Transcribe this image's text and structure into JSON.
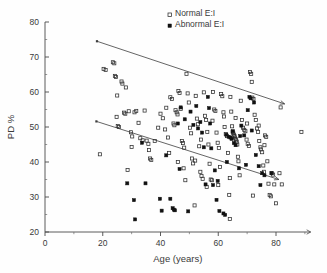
{
  "chart_data": {
    "type": "scatter",
    "title": "",
    "xlabel": "Age (years)",
    "ylabel": "PD %",
    "xlim": [
      0,
      92
    ],
    "ylim": [
      20,
      80
    ],
    "xticks": [
      0,
      20,
      40,
      60,
      80
    ],
    "yticks": [
      20,
      30,
      40,
      50,
      60,
      70,
      80
    ],
    "xtick_labels": [
      "0",
      "20",
      "40",
      "60",
      "80"
    ],
    "ytick_labels": [
      "20",
      "30",
      "40",
      "50",
      "60",
      "70",
      "80"
    ],
    "xminor_step": 10,
    "yminor_step": 5,
    "grid": false,
    "legend_position": "top-center",
    "legend": [
      {
        "label": "Normal E:I",
        "marker": "open-square",
        "color": "#2d2d2d"
      },
      {
        "label": "Abnormal E:I",
        "marker": "filled-square",
        "color": "#111111"
      }
    ],
    "series": [
      {
        "name": "Normal E:I",
        "marker": "open-square",
        "points": [
          [
            19.0,
            42.2
          ],
          [
            20.3,
            66.6
          ],
          [
            21.0,
            66.3
          ],
          [
            23.5,
            68.5
          ],
          [
            24.0,
            68.2
          ],
          [
            24.2,
            64.6
          ],
          [
            24.6,
            64.3
          ],
          [
            25.0,
            59.0
          ],
          [
            24.8,
            52.9
          ],
          [
            25.2,
            50.3
          ],
          [
            25.6,
            50.0
          ],
          [
            26.5,
            63.0
          ],
          [
            26.8,
            62.4
          ],
          [
            27.4,
            54.1
          ],
          [
            27.8,
            53.8
          ],
          [
            28.0,
            61.3
          ],
          [
            28.6,
            37.7
          ],
          [
            29.0,
            54.5
          ],
          [
            29.8,
            48.5
          ],
          [
            30.2,
            47.3
          ],
          [
            31.0,
            54.2
          ],
          [
            31.6,
            54.6
          ],
          [
            32.4,
            51.2
          ],
          [
            33.0,
            46.8
          ],
          [
            33.8,
            46.2
          ],
          [
            34.5,
            54.7
          ],
          [
            35.2,
            46.1
          ],
          [
            35.8,
            45.2
          ],
          [
            36.4,
            41.0
          ],
          [
            36.8,
            40.6
          ],
          [
            38.0,
            46.0
          ],
          [
            39.2,
            49.8
          ],
          [
            40.0,
            53.8
          ],
          [
            40.8,
            52.5
          ],
          [
            41.6,
            49.3
          ],
          [
            42.0,
            55.5
          ],
          [
            42.6,
            47.0
          ],
          [
            43.4,
            58.5
          ],
          [
            44.0,
            58.0
          ],
          [
            44.5,
            51.0
          ],
          [
            44.8,
            50.5
          ],
          [
            45.2,
            54.8
          ],
          [
            45.6,
            54.2
          ],
          [
            45.9,
            53.6
          ],
          [
            46.2,
            60.3
          ],
          [
            46.6,
            59.7
          ],
          [
            47.0,
            55.2
          ],
          [
            47.4,
            46.0
          ],
          [
            47.8,
            45.4
          ],
          [
            48.2,
            44.1
          ],
          [
            48.6,
            34.8
          ],
          [
            49.0,
            65.2
          ],
          [
            49.4,
            59.6
          ],
          [
            49.8,
            57.0
          ],
          [
            50.2,
            49.8
          ],
          [
            50.6,
            48.2
          ],
          [
            50.9,
            41.0
          ],
          [
            51.3,
            39.6
          ],
          [
            51.8,
            27.6
          ],
          [
            52.2,
            58.9
          ],
          [
            52.6,
            52.4
          ],
          [
            53.0,
            50.8
          ],
          [
            53.4,
            44.5
          ],
          [
            53.8,
            37.2
          ],
          [
            54.2,
            36.0
          ],
          [
            54.6,
            35.2
          ],
          [
            55.0,
            59.9
          ],
          [
            55.4,
            53.2
          ],
          [
            55.8,
            52.0
          ],
          [
            56.2,
            48.6
          ],
          [
            56.6,
            45.0
          ],
          [
            57.0,
            39.5
          ],
          [
            57.4,
            35.0
          ],
          [
            57.8,
            34.8
          ],
          [
            58.2,
            60.0
          ],
          [
            58.6,
            55.0
          ],
          [
            59.0,
            54.6
          ],
          [
            59.4,
            48.4
          ],
          [
            59.8,
            45.5
          ],
          [
            60.2,
            44.0
          ],
          [
            60.6,
            38.6
          ],
          [
            61.0,
            59.4
          ],
          [
            61.4,
            58.8
          ],
          [
            61.8,
            54.2
          ],
          [
            62.2,
            50.0
          ],
          [
            62.6,
            48.0
          ],
          [
            63.0,
            47.4
          ],
          [
            63.4,
            42.6
          ],
          [
            63.8,
            30.6
          ],
          [
            64.0,
            23.7
          ],
          [
            64.2,
            58.6
          ],
          [
            64.5,
            54.4
          ],
          [
            64.8,
            50.2
          ],
          [
            65.0,
            48.6
          ],
          [
            65.2,
            48.2
          ],
          [
            65.4,
            47.8
          ],
          [
            65.6,
            47.4
          ],
          [
            65.8,
            47.0
          ],
          [
            66.0,
            46.6
          ],
          [
            66.2,
            46.2
          ],
          [
            66.4,
            45.8
          ],
          [
            66.6,
            45.0
          ],
          [
            66.8,
            41.5
          ],
          [
            67.0,
            40.2
          ],
          [
            67.4,
            36.2
          ],
          [
            67.8,
            57.5
          ],
          [
            68.2,
            52.0
          ],
          [
            68.6,
            49.8
          ],
          [
            69.0,
            49.2
          ],
          [
            69.4,
            48.8
          ],
          [
            69.8,
            46.4
          ],
          [
            70.2,
            45.2
          ],
          [
            70.6,
            44.6
          ],
          [
            71.0,
            65.7
          ],
          [
            71.4,
            65.2
          ],
          [
            71.6,
            62.9
          ],
          [
            71.8,
            58.4
          ],
          [
            72.2,
            58.0
          ],
          [
            72.6,
            53.5
          ],
          [
            73.0,
            52.0
          ],
          [
            73.4,
            49.6
          ],
          [
            73.8,
            48.6
          ],
          [
            74.2,
            46.0
          ],
          [
            74.6,
            44.2
          ],
          [
            74.8,
            43.6
          ],
          [
            75.2,
            42.8
          ],
          [
            75.6,
            39.0
          ],
          [
            75.8,
            37.2
          ],
          [
            76.2,
            47.6
          ],
          [
            76.6,
            47.2
          ],
          [
            77.0,
            40.2
          ],
          [
            77.4,
            33.8
          ],
          [
            77.8,
            30.6
          ],
          [
            78.2,
            30.2
          ],
          [
            78.6,
            36.8
          ],
          [
            79.0,
            36.4
          ],
          [
            79.4,
            33.6
          ],
          [
            80.0,
            28.2
          ],
          [
            81.2,
            36.8
          ],
          [
            81.6,
            55.6
          ],
          [
            82.0,
            33.6
          ],
          [
            88.8,
            48.6
          ],
          [
            30.0,
            44.3
          ],
          [
            36.0,
            43.4
          ],
          [
            43.0,
            42.6
          ],
          [
            52.0,
            40.4
          ],
          [
            58.0,
            51.8
          ],
          [
            62.0,
            53.0
          ],
          [
            66.0,
            52.6
          ],
          [
            70.0,
            51.0
          ],
          [
            74.0,
            50.4
          ],
          [
            46.0,
            40.0
          ],
          [
            54.0,
            46.4
          ],
          [
            48.0,
            38.2
          ],
          [
            56.0,
            32.9
          ],
          [
            60.0,
            33.4
          ],
          [
            64.0,
            35.4
          ],
          [
            72.0,
            30.4
          ],
          [
            76.0,
            44.8
          ]
        ]
      },
      {
        "name": "Abnormal E:I",
        "marker": "filled-square",
        "points": [
          [
            28.5,
            33.9
          ],
          [
            30.8,
            29.1
          ],
          [
            31.2,
            23.6
          ],
          [
            33.6,
            45.5
          ],
          [
            34.8,
            33.9
          ],
          [
            39.8,
            29.5
          ],
          [
            40.4,
            26.1
          ],
          [
            42.0,
            41.9
          ],
          [
            43.4,
            29.5
          ],
          [
            44.2,
            26.8
          ],
          [
            44.6,
            26.4
          ],
          [
            45.0,
            26.2
          ],
          [
            46.0,
            51.0
          ],
          [
            46.6,
            38.0
          ],
          [
            48.4,
            52.2
          ],
          [
            49.6,
            25.9
          ],
          [
            50.4,
            54.4
          ],
          [
            51.4,
            50.6
          ],
          [
            52.4,
            56.0
          ],
          [
            53.0,
            49.6
          ],
          [
            53.8,
            51.4
          ],
          [
            54.4,
            48.4
          ],
          [
            55.0,
            44.2
          ],
          [
            55.6,
            33.6
          ],
          [
            56.4,
            58.6
          ],
          [
            56.8,
            55.4
          ],
          [
            57.2,
            51.0
          ],
          [
            57.6,
            43.9
          ],
          [
            58.2,
            33.4
          ],
          [
            58.8,
            37.6
          ],
          [
            59.4,
            29.2
          ],
          [
            60.4,
            26.0
          ],
          [
            61.8,
            25.3
          ],
          [
            62.4,
            24.9
          ],
          [
            63.0,
            40.0
          ],
          [
            63.6,
            47.2
          ],
          [
            64.2,
            47.0
          ],
          [
            64.6,
            46.6
          ],
          [
            65.0,
            48.8
          ],
          [
            65.4,
            45.4
          ],
          [
            66.0,
            44.8
          ],
          [
            67.2,
            38.2
          ],
          [
            68.0,
            50.4
          ],
          [
            69.0,
            47.6
          ],
          [
            70.2,
            54.8
          ],
          [
            70.8,
            58.6
          ],
          [
            71.2,
            58.2
          ],
          [
            71.6,
            49.0
          ],
          [
            72.4,
            57.0
          ],
          [
            73.0,
            42.0
          ],
          [
            74.0,
            38.8
          ],
          [
            74.6,
            33.4
          ],
          [
            75.2,
            36.8
          ],
          [
            76.0,
            36.2
          ],
          [
            78.4,
            36.8
          ],
          [
            47.0,
            55.6
          ],
          [
            59.8,
            34.6
          ],
          [
            62.8,
            47.8
          ],
          [
            67.6,
            47.4
          ],
          [
            69.6,
            39.2
          ]
        ]
      }
    ],
    "fit_lines": [
      {
        "name": "upper-regression-line",
        "for_series": "Normal E:I",
        "x1": 18.0,
        "y1": 74.5,
        "x2": 83.0,
        "y2": 56.6
      },
      {
        "name": "lower-regression-line",
        "for_series": "Abnormal E:I",
        "x1": 17.8,
        "y1": 51.6,
        "x2": 81.0,
        "y2": 35.0
      }
    ]
  }
}
